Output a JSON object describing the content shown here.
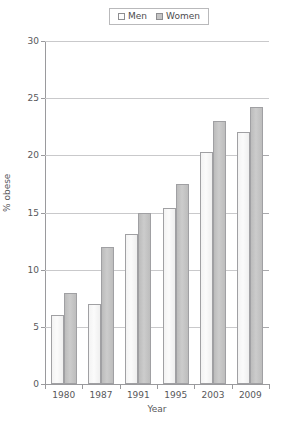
{
  "chart_data": {
    "type": "bar",
    "title": "",
    "xlabel": "Year",
    "ylabel": "% obese",
    "categories": [
      "1980",
      "1987",
      "1991",
      "1995",
      "2003",
      "2009"
    ],
    "series": [
      {
        "name": "Men",
        "swatch_name": "men-swatch",
        "color": "#fbfbfb",
        "values": [
          6.0,
          7.0,
          13.1,
          15.4,
          20.3,
          22.0
        ]
      },
      {
        "name": "Women",
        "swatch_name": "women-swatch",
        "color": "#c4c4c4",
        "values": [
          8.0,
          12.0,
          15.0,
          17.5,
          23.0,
          24.2
        ]
      }
    ],
    "ylim": [
      0,
      30
    ],
    "yticks": [
      0,
      5,
      10,
      15,
      20,
      25,
      30
    ],
    "ytick_labels": [
      "0",
      "5",
      "10",
      "15",
      "20",
      "25",
      "30"
    ],
    "grid": true,
    "legend_position": "top-center"
  },
  "legend": {
    "items": [
      {
        "label": "Men"
      },
      {
        "label": "Women"
      }
    ]
  },
  "axes": {
    "x_title": "Year",
    "y_title": "% obese"
  }
}
